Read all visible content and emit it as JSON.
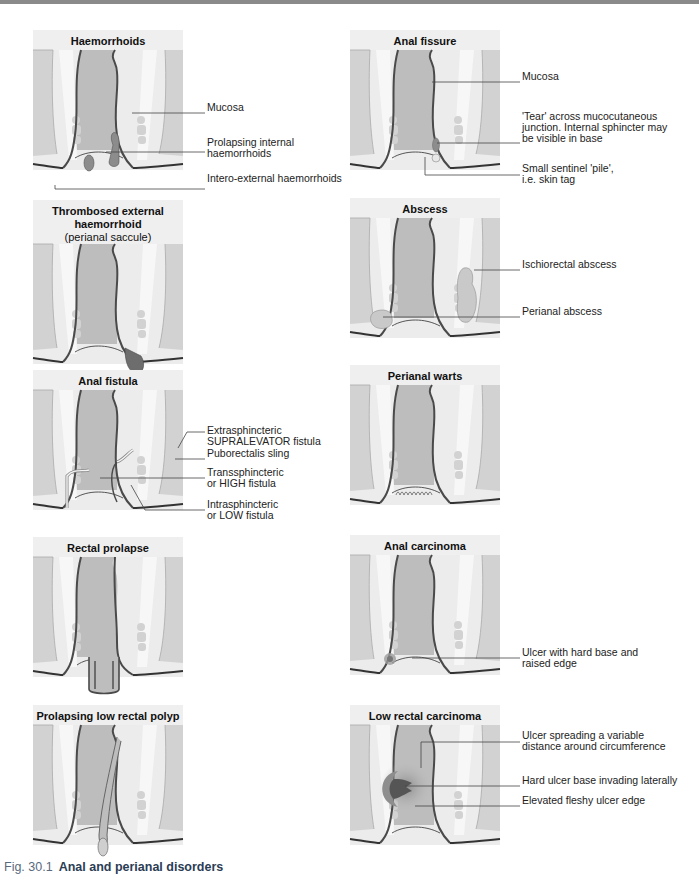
{
  "figure": {
    "caption_number": "Fig. 30.1",
    "caption_title": "Anal and perianal disorders"
  },
  "colors": {
    "title_bg": "#efefef",
    "tissue_grey": "#c9c9c9",
    "lumen_grey": "#bdbdbd",
    "light_tissue": "#ececec",
    "wall_line": "#4a4a4a",
    "lesion_mid": "#8c8c8c",
    "lesion_dark": "#5a5a5a",
    "caption_number": "#5a6a7e",
    "caption_title": "#2b3d55"
  },
  "panels": [
    {
      "id": "haemorrhoids",
      "title": "Haemorrhoids",
      "subtitle": "",
      "x": 33,
      "y": 30,
      "labels": [
        {
          "text": "Mucosa",
          "x": 207,
          "y": 108
        },
        {
          "text": "Prolapsing internal\nhaemorrhoids",
          "x": 207,
          "y": 143
        },
        {
          "text": "Intero-external haemorrhoids",
          "x": 207,
          "y": 179
        }
      ]
    },
    {
      "id": "anal-fissure",
      "title": "Anal fissure",
      "subtitle": "",
      "x": 350,
      "y": 30,
      "labels": [
        {
          "text": "Mucosa",
          "x": 522,
          "y": 77
        },
        {
          "text": "'Tear' across mucocutaneous\njunction. Internal sphincter may\nbe visible in base",
          "x": 522,
          "y": 117
        },
        {
          "text": "Small sentinel 'pile',\ni.e. skin tag",
          "x": 522,
          "y": 169
        }
      ]
    },
    {
      "id": "thrombosed-external-haemorrhoid",
      "title": "Thrombosed external\nhaemorrhoid",
      "subtitle": "(perianal saccule)",
      "x": 33,
      "y": 200,
      "labels": []
    },
    {
      "id": "abscess",
      "title": "Abscess",
      "subtitle": "",
      "x": 350,
      "y": 198,
      "labels": [
        {
          "text": "Ischiorectal abscess",
          "x": 522,
          "y": 265
        },
        {
          "text": "Perianal abscess",
          "x": 522,
          "y": 312
        }
      ]
    },
    {
      "id": "anal-fistula",
      "title": "Anal fistula",
      "subtitle": "",
      "x": 33,
      "y": 370,
      "labels": [
        {
          "text": "Extrasphincteric\nSUPRALEVATOR fistula",
          "x": 207,
          "y": 431
        },
        {
          "text": "Puborectalis sling",
          "x": 207,
          "y": 454
        },
        {
          "text": "Transsphincteric\nor HIGH fistula",
          "x": 207,
          "y": 473
        },
        {
          "text": "Intrasphincteric\nor LOW fistula",
          "x": 207,
          "y": 505
        }
      ]
    },
    {
      "id": "perianal-warts",
      "title": "Perianal warts",
      "subtitle": "",
      "x": 350,
      "y": 365,
      "labels": []
    },
    {
      "id": "rectal-prolapse",
      "title": "Rectal prolapse",
      "subtitle": "",
      "x": 33,
      "y": 537,
      "labels": []
    },
    {
      "id": "anal-carcinoma",
      "title": "Anal carcinoma",
      "subtitle": "",
      "x": 350,
      "y": 535,
      "labels": [
        {
          "text": "Ulcer with hard base and\nraised edge",
          "x": 522,
          "y": 653
        }
      ]
    },
    {
      "id": "prolapsing-low-rectal-polyp",
      "title": "Prolapsing low rectal polyp",
      "subtitle": "",
      "x": 33,
      "y": 705,
      "labels": []
    },
    {
      "id": "low-rectal-carcinoma",
      "title": "Low rectal carcinoma",
      "subtitle": "",
      "x": 350,
      "y": 705,
      "labels": [
        {
          "text": "Ulcer spreading a variable\ndistance around circumference",
          "x": 522,
          "y": 736
        },
        {
          "text": "Hard ulcer base invading laterally",
          "x": 522,
          "y": 781
        },
        {
          "text": "Elevated fleshy ulcer edge",
          "x": 522,
          "y": 801
        }
      ]
    }
  ]
}
